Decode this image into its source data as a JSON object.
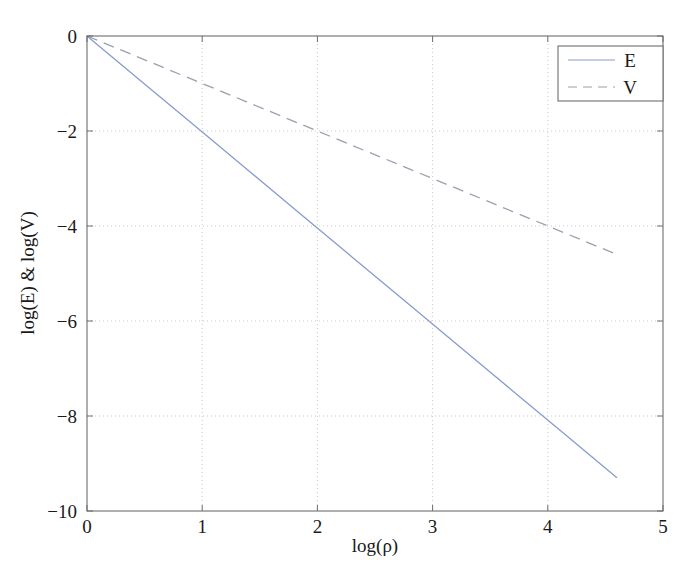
{
  "chart_data": {
    "type": "line",
    "title": "",
    "xlabel": "log(ρ)",
    "ylabel": "log(E) & log(V)",
    "xlim": [
      0,
      5
    ],
    "ylim": [
      -10,
      0
    ],
    "xticks": [
      0,
      1,
      2,
      3,
      4,
      5
    ],
    "xtick_labels": [
      "0",
      "1",
      "2",
      "3",
      "4",
      "5"
    ],
    "yticks": [
      0,
      -2,
      -4,
      -6,
      -8,
      -10
    ],
    "ytick_labels": [
      "0",
      "−2",
      "−4",
      "−6",
      "−8",
      "−10"
    ],
    "grid": true,
    "grid_style": "dotted",
    "legend_position": "top-right",
    "series": [
      {
        "name": "E",
        "style": "solid",
        "color": "#8a9ad0",
        "slope": -2.02,
        "intercept": 0,
        "x": [
          0.0,
          0.46,
          0.92,
          1.38,
          1.84,
          2.3,
          2.76,
          3.22,
          3.68,
          4.14,
          4.6
        ],
        "y": [
          0.0,
          -0.93,
          -1.86,
          -2.79,
          -3.72,
          -4.65,
          -5.58,
          -6.51,
          -7.44,
          -8.37,
          -9.3
        ]
      },
      {
        "name": "V",
        "style": "dashed",
        "color": "#9aa0ae",
        "slope": -1.0,
        "intercept": 0,
        "x": [
          0.0,
          0.46,
          0.92,
          1.38,
          1.84,
          2.3,
          2.76,
          3.22,
          3.68,
          4.14,
          4.6
        ],
        "y": [
          0.0,
          -0.46,
          -0.92,
          -1.38,
          -1.84,
          -2.3,
          -2.76,
          -3.22,
          -3.68,
          -4.14,
          -4.6
        ]
      }
    ]
  },
  "legend": {
    "entries": [
      {
        "label": "E",
        "style": "solid",
        "color": "#8a9ad0"
      },
      {
        "label": "V",
        "style": "dashed",
        "color": "#9aa0ae"
      }
    ]
  },
  "axes": {
    "frame_color": "#6d6d6d",
    "grid_color": "#c9c9c9",
    "background": "#ffffff"
  }
}
